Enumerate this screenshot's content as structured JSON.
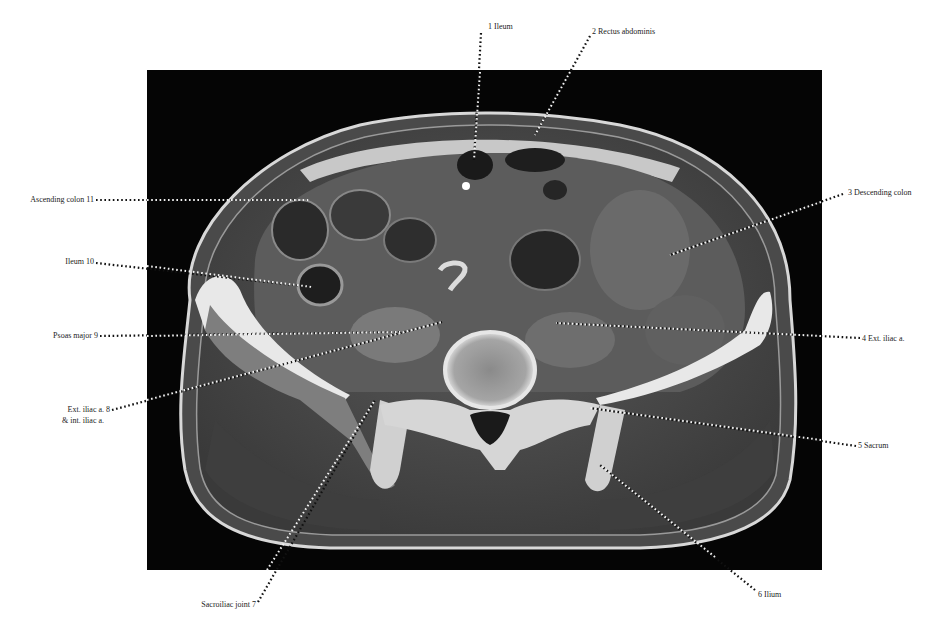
{
  "figure": {
    "type": "axial CT scan, pelvis at sacroiliac level",
    "colors": {
      "background": "#ffffff",
      "panel": "#050505",
      "label_text": "#222222",
      "leader_dots": "#111111"
    }
  },
  "labels": {
    "l1": {
      "number": "1",
      "text": "Ileum"
    },
    "l2": {
      "number": "2",
      "text": "Rectus abdominis"
    },
    "l3": {
      "number": "3",
      "text": "Descending colon"
    },
    "l4": {
      "number": "4",
      "text": "Ext. iliac a."
    },
    "l5": {
      "number": "5",
      "text": "Sacrum"
    },
    "l6": {
      "number": "6",
      "text": "Ilium"
    },
    "l7": {
      "number": "7",
      "text": "Sacroiliac joint"
    },
    "l8": {
      "number": "8",
      "text": "Ext. iliac a.",
      "text2": "& int. iliac a."
    },
    "l9": {
      "number": "9",
      "text": "Psoas major"
    },
    "l10": {
      "number": "10",
      "text": "Ileum"
    },
    "l11": {
      "number": "11",
      "text": "Ascending colon"
    }
  },
  "display": {
    "l1": "1 Ileum",
    "l2": "2 Rectus abdominis",
    "l3": "3  Descending colon",
    "l4": "4 Ext. iliac a.",
    "l5": "5 Sacrum",
    "l6": "6 Ilium",
    "l7": "Sacroiliac joint  7",
    "l8a": "Ext. iliac a.  8",
    "l8b": "& int. iliac a.",
    "l9": "Psoas major  9",
    "l10": "Ileum  10",
    "l11": "Ascending colon 11"
  }
}
